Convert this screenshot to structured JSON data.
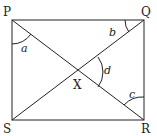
{
  "diagram": {
    "type": "geometry",
    "shape": "rectangle PQRS with diagonals PR and QS intersecting at X",
    "vertices": {
      "P": "P",
      "Q": "Q",
      "R": "R",
      "S": "S",
      "X": "X"
    },
    "angles": {
      "a": "a",
      "b": "b",
      "c": "c",
      "d": "d"
    },
    "line_color": "#222222"
  }
}
